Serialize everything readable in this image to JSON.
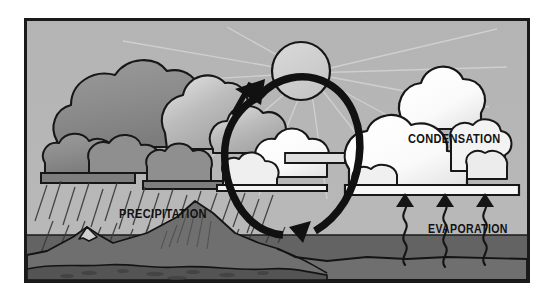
{
  "diagram": {
    "frame": {
      "border_color": "#1a1a1a",
      "outer_background": "#ffffff"
    },
    "colors": {
      "sky": "#b0b0b0",
      "sky_light": "#bdbdbd",
      "water": "#636363",
      "land_mid": "#737373",
      "land_dark": "#595959",
      "cloud_dark": "#8d8d8d",
      "cloud_mid": "#a8a8a8",
      "cloud_light": "#e8e8e8",
      "cloud_white": "#fbfbfb",
      "sun": "#cfcfcf",
      "ink": "#141414",
      "ray": "#d7d7d7"
    },
    "labels": [
      {
        "id": "precipitation",
        "text": "PRECIPITATION"
      },
      {
        "id": "condensation",
        "text": "CONDENSATION"
      },
      {
        "id": "evaporation",
        "text": "EVAPORATION"
      }
    ],
    "elements": {
      "sun": "sun-circle",
      "cycle_arrow": "circular-cycle-arrow",
      "rain": "rain-hatch-lines",
      "mountains": "mountain-range",
      "water_body": "ocean-surface",
      "evaporation_streams": 3,
      "rain_clouds": "dark-storm-clouds-left",
      "condensation_clouds": "white-clouds-right"
    }
  }
}
